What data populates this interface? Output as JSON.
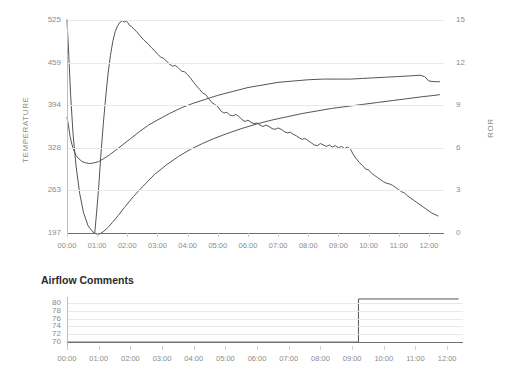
{
  "chart_data": [
    {
      "type": "line",
      "title": "",
      "xlabel": "",
      "ylabel": "TEMPERATURE",
      "y2label": "ROR",
      "grid": true,
      "legend": "none",
      "xlim": [
        0,
        12.5
      ],
      "ylim": [
        197,
        525
      ],
      "y2lim": [
        0,
        15
      ],
      "xtick_labels": [
        "00:00",
        "01:00",
        "02:00",
        "03:00",
        "04:00",
        "05:00",
        "06:00",
        "07:00",
        "08:00",
        "09:00",
        "10:00",
        "11:00",
        "12:00"
      ],
      "xticks": [
        0,
        1,
        2,
        3,
        4,
        5,
        6,
        7,
        8,
        9,
        10,
        11,
        12
      ],
      "yticks": [
        197,
        263,
        328,
        394,
        459,
        525
      ],
      "y2ticks": [
        0,
        3,
        6,
        9,
        12,
        15
      ],
      "series": [
        {
          "name": "Environmental Temperature",
          "axis": "left",
          "color": "#555555",
          "x": [
            0.0,
            0.05,
            0.1,
            0.16,
            0.22,
            0.3,
            0.4,
            0.5,
            0.62,
            0.75,
            0.9,
            1.05,
            1.2,
            1.4,
            1.6,
            1.85,
            2.1,
            2.4,
            2.7,
            3.0,
            3.4,
            3.8,
            4.2,
            4.6,
            5.0,
            5.5,
            6.0,
            6.5,
            7.0,
            7.5,
            8.0,
            8.5,
            9.0,
            9.4,
            9.8,
            10.2,
            10.6,
            11.0,
            11.4,
            11.7,
            11.85,
            12.0,
            12.2,
            12.35
          ],
          "values": [
            375,
            362,
            346,
            334,
            325,
            316,
            311,
            307,
            305,
            304,
            305,
            307,
            311,
            317,
            324,
            333,
            342,
            353,
            363,
            371,
            381,
            390,
            397,
            403,
            409,
            415,
            421,
            425,
            429,
            431,
            433,
            434,
            434,
            434,
            435,
            436,
            437,
            438,
            439,
            440,
            438,
            431,
            430,
            430
          ]
        },
        {
          "name": "Bean Temperature",
          "axis": "left",
          "color": "#555555",
          "x": [
            0.0,
            0.06,
            0.12,
            0.2,
            0.3,
            0.42,
            0.55,
            0.7,
            0.85,
            0.95,
            1.02,
            1.1,
            1.2,
            1.35,
            1.5,
            1.7,
            1.9,
            2.2,
            2.5,
            2.9,
            3.3,
            3.7,
            4.1,
            4.5,
            4.9,
            5.3,
            5.8,
            6.3,
            6.8,
            7.3,
            7.8,
            8.3,
            8.8,
            9.3,
            9.8,
            10.3,
            10.8,
            11.3,
            11.8,
            12.2,
            12.35
          ],
          "values": [
            525,
            470,
            410,
            350,
            300,
            258,
            228,
            208,
            199,
            196,
            195,
            196,
            199,
            205,
            213,
            224,
            236,
            253,
            268,
            287,
            302,
            315,
            326,
            335,
            343,
            350,
            358,
            365,
            371,
            376,
            381,
            385,
            389,
            392,
            395,
            398,
            401,
            404,
            407,
            409,
            410
          ]
        },
        {
          "name": "Rate of Rise (ROR)",
          "axis": "right",
          "color": "#555555",
          "x": [
            0.92,
            0.98,
            1.05,
            1.12,
            1.2,
            1.28,
            1.36,
            1.44,
            1.52,
            1.6,
            1.68,
            1.76,
            1.84,
            1.9,
            1.96,
            2.02,
            2.08,
            2.14,
            2.22,
            2.3,
            2.38,
            2.46,
            2.54,
            2.62,
            2.7,
            2.8,
            2.9,
            3.0,
            3.1,
            3.2,
            3.3,
            3.4,
            3.5,
            3.6,
            3.7,
            3.8,
            3.9,
            4.0,
            4.1,
            4.2,
            4.3,
            4.4,
            4.5,
            4.6,
            4.7,
            4.8,
            4.9,
            5.0,
            5.1,
            5.2,
            5.3,
            5.4,
            5.5,
            5.6,
            5.7,
            5.8,
            5.9,
            6.0,
            6.1,
            6.2,
            6.3,
            6.4,
            6.5,
            6.6,
            6.7,
            6.8,
            6.9,
            7.0,
            7.1,
            7.2,
            7.3,
            7.4,
            7.5,
            7.6,
            7.7,
            7.8,
            7.9,
            8.0,
            8.1,
            8.2,
            8.3,
            8.4,
            8.5,
            8.6,
            8.7,
            8.8,
            8.9,
            9.0,
            9.1,
            9.2,
            9.3,
            9.4,
            9.5,
            9.6,
            9.7,
            9.8,
            9.9,
            10.0,
            10.1,
            10.2,
            10.3,
            10.4,
            10.5,
            10.6,
            10.7,
            10.8,
            10.9,
            11.0,
            11.1,
            11.2,
            11.3,
            11.4,
            11.5,
            11.6,
            11.7,
            11.8,
            11.9,
            12.0,
            12.1,
            12.2,
            12.3
          ],
          "values": [
            0.0,
            1.4,
            3.2,
            5.4,
            7.6,
            9.5,
            11.2,
            12.5,
            13.5,
            14.2,
            14.6,
            14.85,
            14.95,
            14.85,
            14.95,
            14.8,
            14.6,
            14.55,
            14.35,
            14.2,
            14.0,
            13.8,
            13.6,
            13.45,
            13.3,
            13.05,
            12.85,
            12.6,
            12.4,
            12.3,
            12.1,
            11.9,
            11.75,
            11.8,
            11.6,
            11.4,
            11.35,
            11.15,
            10.9,
            10.6,
            10.35,
            10.1,
            9.85,
            9.75,
            9.45,
            9.2,
            9.05,
            8.9,
            8.6,
            8.45,
            8.5,
            8.3,
            8.25,
            8.35,
            8.2,
            8.0,
            7.85,
            7.95,
            7.8,
            7.7,
            7.75,
            7.6,
            7.5,
            7.6,
            7.5,
            7.35,
            7.3,
            7.4,
            7.3,
            7.15,
            7.05,
            7.1,
            6.95,
            6.85,
            6.7,
            6.6,
            6.65,
            6.5,
            6.35,
            6.2,
            6.15,
            6.3,
            6.2,
            6.1,
            6.2,
            6.05,
            6.15,
            6.0,
            6.1,
            5.95,
            6.05,
            5.9,
            5.5,
            5.2,
            4.95,
            4.75,
            4.5,
            4.45,
            4.2,
            4.05,
            3.9,
            3.75,
            3.6,
            3.5,
            3.45,
            3.35,
            3.2,
            3.05,
            2.9,
            2.8,
            2.6,
            2.45,
            2.3,
            2.15,
            2.0,
            1.85,
            1.7,
            1.55,
            1.4,
            1.3,
            1.2
          ]
        }
      ]
    },
    {
      "type": "line",
      "title": "Airflow Comments",
      "xlabel": "",
      "ylabel": "",
      "grid": true,
      "legend": "none",
      "xlim": [
        0,
        12.5
      ],
      "ylim": [
        69,
        81.5
      ],
      "xtick_labels": [
        "00:00",
        "01:00",
        "02:00",
        "03:00",
        "04:00",
        "05:00",
        "06:00",
        "07:00",
        "08:00",
        "09:00",
        "10:00",
        "11:00",
        "12:00"
      ],
      "xticks": [
        0,
        1,
        2,
        3,
        4,
        5,
        6,
        7,
        8,
        9,
        10,
        11,
        12
      ],
      "yticks": [
        70,
        72,
        74,
        76,
        78,
        80
      ],
      "series": [
        {
          "name": "Airflow",
          "axis": "left",
          "color": "#555555",
          "step": true,
          "x": [
            0.0,
            9.2,
            9.2,
            12.35
          ],
          "values": [
            70.0,
            70.0,
            81.0,
            81.0
          ]
        }
      ]
    }
  ]
}
